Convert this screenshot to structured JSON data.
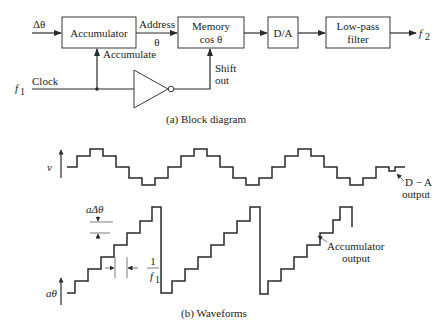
{
  "block_diagram": {
    "input_label": "Δθ",
    "clock_freq_label": "f",
    "clock_freq_sub": "1",
    "clock_label": "Clock",
    "blocks": [
      {
        "id": "accumulator",
        "label": "Accumulator"
      },
      {
        "id": "memory",
        "label_line1": "Memory",
        "label_line2": "cos θ"
      },
      {
        "id": "dac",
        "label": "D/A"
      },
      {
        "id": "lpf",
        "label_line1": "Low-pass",
        "label_line2": "filter"
      }
    ],
    "address_label": "Address",
    "address_theta": "θ",
    "accumulate_label": "Accumulate",
    "shift_out_line1": "Shift",
    "shift_out_line2": "out",
    "output_label": "f",
    "output_sub": "2",
    "caption": "(a) Block diagram"
  },
  "waveforms": {
    "v_label": "v",
    "atheta_label": "aθ",
    "step_label": "aΔθ",
    "period_num": "1",
    "period_den": "f",
    "period_den_sub": "1",
    "dac_output_line1": "D − A",
    "dac_output_line2": "output",
    "acc_output_line1": "Accumulator",
    "acc_output_line2": "output",
    "caption": "(b) Waveforms"
  }
}
